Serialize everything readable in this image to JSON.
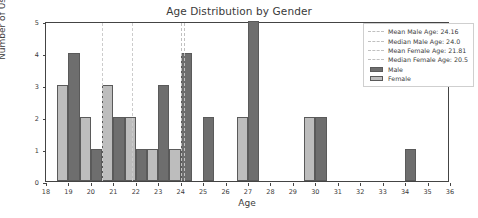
{
  "chart_data": {
    "type": "bar",
    "title": "Age Distribution by Gender",
    "xlabel": "Age",
    "ylabel": "Number of Users",
    "xlim": [
      18,
      36
    ],
    "ylim": [
      0,
      5
    ],
    "grid": false,
    "legend_position": "upper right",
    "xticks": [
      18,
      19,
      20,
      21,
      22,
      23,
      24,
      25,
      26,
      27,
      28,
      29,
      30,
      31,
      32,
      33,
      34,
      35,
      36
    ],
    "yticks": [
      0,
      1,
      2,
      3,
      4,
      5
    ],
    "series": [
      {
        "name": "Male",
        "color": "#6e6e6e",
        "bars": [
          {
            "x": 19.0,
            "width": 0.5,
            "value": 4
          },
          {
            "x": 20.0,
            "width": 0.5,
            "value": 1
          },
          {
            "x": 21.0,
            "width": 0.5,
            "value": 2
          },
          {
            "x": 22.0,
            "width": 0.5,
            "value": 1
          },
          {
            "x": 23.0,
            "width": 0.5,
            "value": 3
          },
          {
            "x": 24.0,
            "width": 0.5,
            "value": 4
          },
          {
            "x": 25.0,
            "width": 0.5,
            "value": 2
          },
          {
            "x": 27.0,
            "width": 0.5,
            "value": 5
          },
          {
            "x": 30.0,
            "width": 0.5,
            "value": 2
          },
          {
            "x": 34.0,
            "width": 0.5,
            "value": 1
          }
        ]
      },
      {
        "name": "Female",
        "color": "#bdbdbd",
        "bars": [
          {
            "x": 18.5,
            "width": 0.5,
            "value": 3
          },
          {
            "x": 19.5,
            "width": 0.5,
            "value": 2
          },
          {
            "x": 20.5,
            "width": 0.5,
            "value": 3
          },
          {
            "x": 21.5,
            "width": 0.5,
            "value": 2
          },
          {
            "x": 22.5,
            "width": 0.5,
            "value": 1
          },
          {
            "x": 23.5,
            "width": 0.5,
            "value": 1
          },
          {
            "x": 26.5,
            "width": 0.5,
            "value": 2
          },
          {
            "x": 29.5,
            "width": 0.5,
            "value": 2
          }
        ]
      }
    ],
    "reference_lines": [
      {
        "label": "Mean Male Age: 24.16",
        "value": 24.16,
        "style": "dashed",
        "color": "#c0c0c0"
      },
      {
        "label": "Median Male Age: 24.0",
        "value": 24.0,
        "style": "dashed",
        "color": "#c0c0c0"
      },
      {
        "label": "Mean Female Age: 21.81",
        "value": 21.81,
        "style": "dashed",
        "color": "#cccccc"
      },
      {
        "label": "Median Female Age: 20.5",
        "value": 20.5,
        "style": "dashed",
        "color": "#cccccc"
      }
    ],
    "legend_entries": [
      {
        "label": "Mean Male Age: 24.16",
        "key": "dash"
      },
      {
        "label": "Median Male Age: 24.0",
        "key": "dash"
      },
      {
        "label": "Mean Female Age: 21.81",
        "key": "dash"
      },
      {
        "label": "Median Female Age: 20.5",
        "key": "dash"
      },
      {
        "label": "Male",
        "key": "patch-male"
      },
      {
        "label": "Female",
        "key": "patch-female"
      }
    ]
  }
}
